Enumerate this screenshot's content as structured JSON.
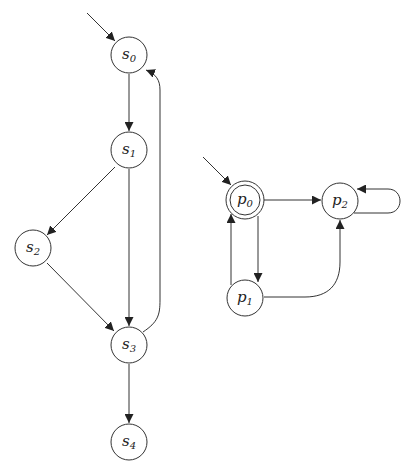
{
  "diagram": {
    "type": "state-transition-graphs",
    "graphs": [
      {
        "name": "s-graph",
        "initial_state": "s0",
        "states": [
          {
            "id": "s0",
            "base": "s",
            "sub": "0",
            "cx": 129,
            "cy": 55,
            "accepting": false
          },
          {
            "id": "s1",
            "base": "s",
            "sub": "1",
            "cx": 129,
            "cy": 150,
            "accepting": false
          },
          {
            "id": "s2",
            "base": "s",
            "sub": "2",
            "cx": 33,
            "cy": 248,
            "accepting": false
          },
          {
            "id": "s3",
            "base": "s",
            "sub": "3",
            "cx": 129,
            "cy": 345,
            "accepting": false
          },
          {
            "id": "s4",
            "base": "s",
            "sub": "4",
            "cx": 129,
            "cy": 442,
            "accepting": false
          }
        ],
        "transitions": [
          {
            "from": "s0",
            "to": "s1"
          },
          {
            "from": "s1",
            "to": "s2"
          },
          {
            "from": "s1",
            "to": "s3"
          },
          {
            "from": "s2",
            "to": "s3"
          },
          {
            "from": "s3",
            "to": "s0"
          },
          {
            "from": "s3",
            "to": "s4"
          }
        ]
      },
      {
        "name": "p-graph",
        "initial_state": "p0",
        "states": [
          {
            "id": "p0",
            "base": "p",
            "sub": "0",
            "cx": 245,
            "cy": 200,
            "accepting": true
          },
          {
            "id": "p1",
            "base": "p",
            "sub": "1",
            "cx": 245,
            "cy": 298,
            "accepting": false
          },
          {
            "id": "p2",
            "base": "p",
            "sub": "2",
            "cx": 340,
            "cy": 201,
            "accepting": false
          }
        ],
        "transitions": [
          {
            "from": "p0",
            "to": "p2"
          },
          {
            "from": "p0",
            "to": "p1"
          },
          {
            "from": "p1",
            "to": "p0"
          },
          {
            "from": "p1",
            "to": "p2"
          },
          {
            "from": "p2",
            "to": "p2"
          }
        ]
      }
    ],
    "labels": {
      "s0": {
        "base": "s",
        "sub": "0"
      },
      "s1": {
        "base": "s",
        "sub": "1"
      },
      "s2": {
        "base": "s",
        "sub": "2"
      },
      "s3": {
        "base": "s",
        "sub": "3"
      },
      "s4": {
        "base": "s",
        "sub": "4"
      },
      "p0": {
        "base": "p",
        "sub": "0"
      },
      "p1": {
        "base": "p",
        "sub": "1"
      },
      "p2": {
        "base": "p",
        "sub": "2"
      }
    },
    "colors": {
      "stroke": "#333333",
      "background": "#ffffff",
      "text": "#222222"
    }
  }
}
